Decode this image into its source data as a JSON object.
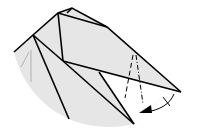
{
  "diagram": {
    "type": "origami-fold-step",
    "colors": {
      "background": "#ffffff",
      "paper_shade": "#e6e6e6",
      "line": "#000000",
      "faint_line": "#888888"
    },
    "elements": {
      "fold_arrow": "curved-arrow-with-valley-fold",
      "crease_lines": "dash-dot mountain/valley folds"
    }
  }
}
